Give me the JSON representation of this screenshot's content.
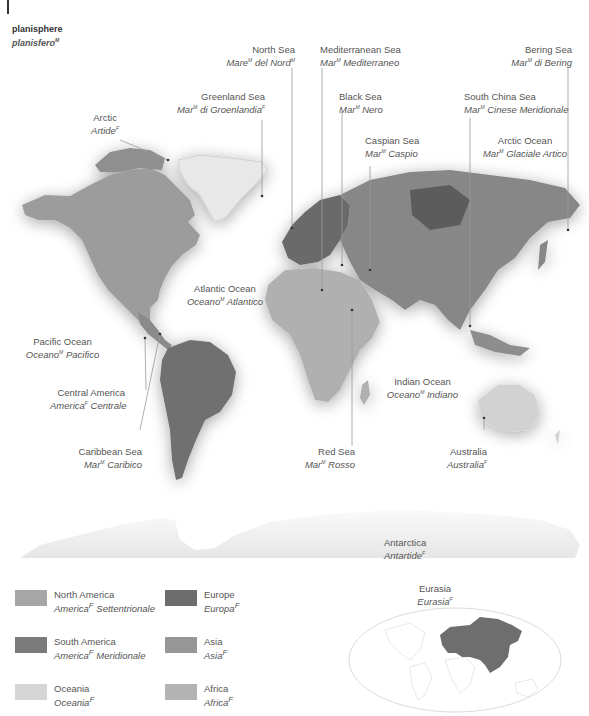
{
  "title": {
    "en": "planisphere",
    "it": "planisfero",
    "it_gender": "M"
  },
  "labels": [
    {
      "id": "north-sea",
      "en": "North Sea",
      "it": "Mare",
      "it_sup": "M",
      "it_rest": " del Nord",
      "it_sup2": "M"
    },
    {
      "id": "mediterranean-sea",
      "en": "Mediterranean Sea",
      "it": "Mar",
      "it_sup": "M",
      "it_rest": " Mediterraneo"
    },
    {
      "id": "bering-sea",
      "en": "Bering Sea",
      "it": "Mar",
      "it_sup": "M",
      "it_rest": " di Bering"
    },
    {
      "id": "greenland-sea",
      "en": "Greenland Sea",
      "it": "Mar",
      "it_sup": "M",
      "it_rest": " di Groenlandia",
      "it_sup2": "F"
    },
    {
      "id": "black-sea",
      "en": "Black Sea",
      "it": "Mar",
      "it_sup": "M",
      "it_rest": " Nero"
    },
    {
      "id": "south-china-sea",
      "en": "South China Sea",
      "it": "Mar",
      "it_sup": "M",
      "it_rest": " Cinese Meridionale"
    },
    {
      "id": "arctic",
      "en": "Arctic",
      "it": "Artide",
      "it_sup": "F",
      "it_rest": ""
    },
    {
      "id": "caspian-sea",
      "en": "Caspian Sea",
      "it": "Mar",
      "it_sup": "M",
      "it_rest": " Caspio"
    },
    {
      "id": "arctic-ocean",
      "en": "Arctic Ocean",
      "it": "Mar",
      "it_sup": "M",
      "it_rest": " Glaciale Artico"
    },
    {
      "id": "atlantic-ocean",
      "en": "Atlantic Ocean",
      "it": "Oceano",
      "it_sup": "M",
      "it_rest": " Atlantico"
    },
    {
      "id": "pacific-ocean",
      "en": "Pacific Ocean",
      "it": "Oceano",
      "it_sup": "M",
      "it_rest": " Pacifico"
    },
    {
      "id": "central-america",
      "en": "Central America",
      "it": "America",
      "it_sup": "F",
      "it_rest": " Centrale"
    },
    {
      "id": "indian-ocean",
      "en": "Indian Ocean",
      "it": "Oceano",
      "it_sup": "M",
      "it_rest": " Indiano"
    },
    {
      "id": "caribbean-sea",
      "en": "Caribbean Sea",
      "it": "Mar",
      "it_sup": "M",
      "it_rest": " Caribico"
    },
    {
      "id": "red-sea",
      "en": "Red Sea",
      "it": "Mar",
      "it_sup": "M",
      "it_rest": " Rosso"
    },
    {
      "id": "australia",
      "en": "Australia",
      "it": "Australia",
      "it_sup": "F",
      "it_rest": ""
    },
    {
      "id": "antarctica",
      "en": "Antarctica",
      "it": "Antartide",
      "it_sup": "F",
      "it_rest": ""
    }
  ],
  "legend": [
    {
      "en": "North America",
      "it": "America",
      "it_sup": "F",
      "it_rest": " Settentrionale",
      "color": "#a6a6a6"
    },
    {
      "en": "Europe",
      "it": "Europa",
      "it_sup": "F",
      "it_rest": "",
      "color": "#6d6d6d"
    },
    {
      "en": "South America",
      "it": "America",
      "it_sup": "F",
      "it_rest": " Meridionale",
      "color": "#7a7a7a"
    },
    {
      "en": "Asia",
      "it": "Asia",
      "it_sup": "F",
      "it_rest": "",
      "color": "#979797"
    },
    {
      "en": "Oceania",
      "it": "Oceania",
      "it_sup": "F",
      "it_rest": "",
      "color": "#d6d6d6"
    },
    {
      "en": "Africa",
      "it": "Africa",
      "it_sup": "F",
      "it_rest": "",
      "color": "#b3b3b3"
    }
  ],
  "inset": {
    "en": "Eurasia",
    "it": "Eurasia",
    "it_sup": "F",
    "highlight_color": "#6e6e6e",
    "outline_color": "#dcdcdc"
  }
}
